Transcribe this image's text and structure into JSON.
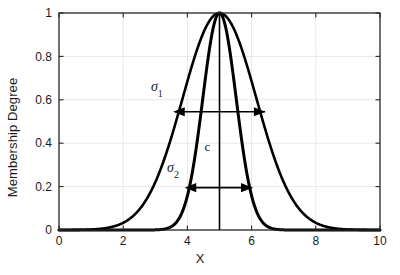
{
  "chart_data": {
    "type": "line",
    "title": "",
    "xlabel": "X",
    "ylabel": "Membership Degree",
    "xlim": [
      0,
      10
    ],
    "ylim": [
      0,
      1
    ],
    "xticks": [
      "0",
      "2",
      "4",
      "6",
      "8",
      "10"
    ],
    "xtick_values": [
      0,
      2,
      4,
      6,
      8,
      10
    ],
    "yticks": [
      "0",
      "0.2",
      "0.4",
      "0.6",
      "0.8",
      "1"
    ],
    "ytick_values": [
      0,
      0.2,
      0.4,
      0.6,
      0.8,
      1
    ],
    "grid": true,
    "legend": "none",
    "series": [
      {
        "name": "wide-gaussian",
        "function": "gaussian",
        "center": 5,
        "sigma": 1.15,
        "peak": 1,
        "color": "#000000",
        "linewidth": 2.6
      },
      {
        "name": "narrow-gaussian",
        "function": "gaussian",
        "center": 5,
        "sigma": 0.52,
        "peak": 1,
        "color": "#000000",
        "linewidth": 3.0
      }
    ],
    "annotations": [
      {
        "name": "sigma-1-label",
        "text": "σ",
        "subscript": "1",
        "x": 3.05,
        "y": 0.64
      },
      {
        "name": "sigma-2-label",
        "text": "σ",
        "subscript": "2",
        "x": 3.55,
        "y": 0.265
      },
      {
        "name": "center-label",
        "text": "c",
        "x": 4.62,
        "y": 0.365
      }
    ],
    "arrows": [
      {
        "name": "sigma-1-arrow",
        "y": 0.545,
        "x_start": 3.62,
        "x_end": 6.42,
        "double_headed": true
      },
      {
        "name": "sigma-2-arrow",
        "y": 0.195,
        "x_start": 3.98,
        "x_end": 6.02,
        "double_headed": true
      }
    ],
    "center_line": {
      "name": "center-vertical-line",
      "x": 5,
      "y_start": 0,
      "y_end": 1
    },
    "colors": {
      "curve": "#000000",
      "axis": "#262626",
      "grid": "#e8e8e8",
      "text": "#1a1a1a",
      "background": "#ffffff"
    }
  }
}
